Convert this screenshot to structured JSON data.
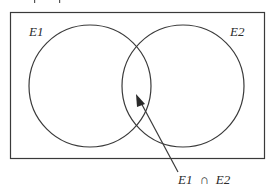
{
  "diagram": {
    "type": "venn",
    "colors": {
      "stroke": "#3a3a3a",
      "text": "#2a2a2a",
      "background": "#ffffff"
    },
    "universe": {
      "label": ""
    },
    "sets": [
      {
        "id": "E1",
        "label": "E1"
      },
      {
        "id": "E2",
        "label": "E2"
      }
    ],
    "intersection": {
      "label_left": "E1",
      "operator": "∩",
      "label_right": "E2",
      "pointer": "arrow"
    }
  }
}
